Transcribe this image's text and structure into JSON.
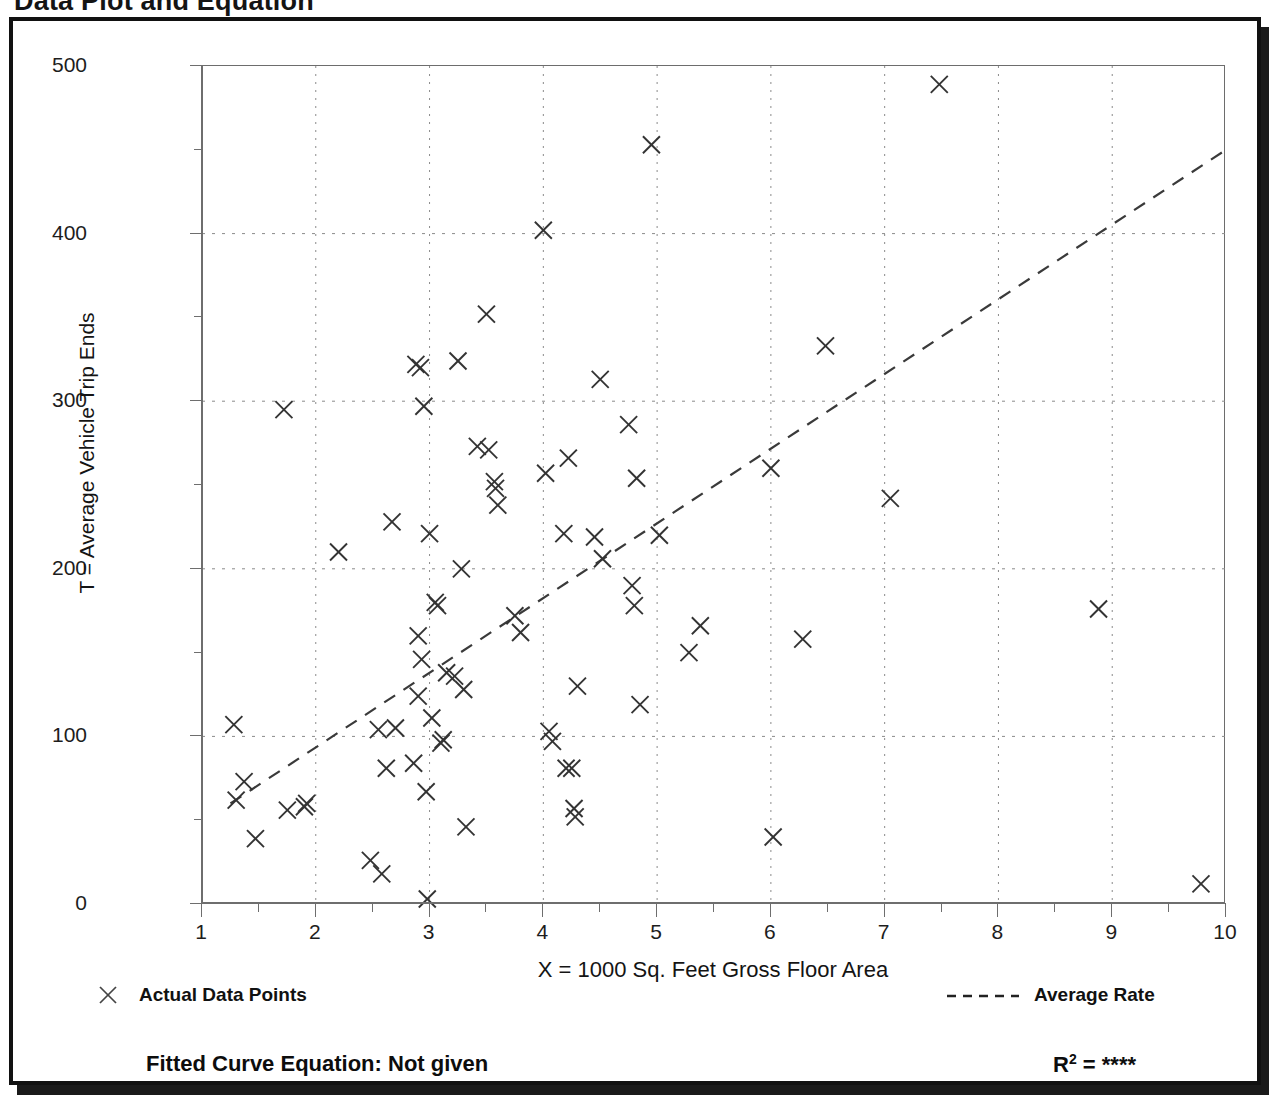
{
  "page": {
    "title": "Data Plot and Equation"
  },
  "footer": {
    "fitted_equation_label": "Fitted Curve Equation:  Not given",
    "r_squared_label": "R",
    "r_squared_exponent": "2",
    "r_squared_value": " = ****"
  },
  "legend": {
    "points_label": "Actual Data Points",
    "line_label": "Average Rate",
    "marker_icon": "x-marker-icon",
    "line_icon": "dashed-line-icon"
  },
  "chart_data": {
    "type": "scatter",
    "title": "Data Plot and Equation",
    "xlabel": "X = 1000 Sq. Feet Gross Floor Area",
    "ylabel": "T = Average Vehicle Trip Ends",
    "xlim": [
      1,
      10
    ],
    "ylim": [
      0,
      500
    ],
    "xticks": [
      1,
      2,
      3,
      4,
      5,
      6,
      7,
      8,
      9,
      10
    ],
    "yticks": [
      0,
      100,
      200,
      300,
      400,
      500
    ],
    "x_minor_step": 0.5,
    "y_minor_step": 50,
    "grid": true,
    "grid_style": "dotted",
    "legend_position": "below-plot",
    "series": [
      {
        "name": "Actual Data Points",
        "marker": "x",
        "color": "#333333",
        "points": [
          [
            1.28,
            107
          ],
          [
            1.3,
            62
          ],
          [
            1.37,
            73
          ],
          [
            1.47,
            39
          ],
          [
            1.72,
            295
          ],
          [
            1.75,
            56
          ],
          [
            1.9,
            58
          ],
          [
            1.92,
            60
          ],
          [
            2.2,
            210
          ],
          [
            2.48,
            26
          ],
          [
            2.55,
            104
          ],
          [
            2.58,
            18
          ],
          [
            2.62,
            81
          ],
          [
            2.67,
            228
          ],
          [
            2.7,
            105
          ],
          [
            2.86,
            84
          ],
          [
            2.88,
            322
          ],
          [
            2.9,
            160
          ],
          [
            2.9,
            124
          ],
          [
            2.92,
            320
          ],
          [
            2.93,
            146
          ],
          [
            2.95,
            297
          ],
          [
            2.97,
            67
          ],
          [
            2.98,
            3
          ],
          [
            3.0,
            221
          ],
          [
            3.02,
            111
          ],
          [
            3.05,
            180
          ],
          [
            3.07,
            178
          ],
          [
            3.1,
            96
          ],
          [
            3.12,
            98
          ],
          [
            3.15,
            138
          ],
          [
            3.22,
            136
          ],
          [
            3.25,
            324
          ],
          [
            3.28,
            200
          ],
          [
            3.3,
            128
          ],
          [
            3.32,
            46
          ],
          [
            3.42,
            273
          ],
          [
            3.5,
            352
          ],
          [
            3.52,
            271
          ],
          [
            3.57,
            252
          ],
          [
            3.58,
            248
          ],
          [
            3.6,
            238
          ],
          [
            3.75,
            172
          ],
          [
            3.8,
            162
          ],
          [
            4.0,
            402
          ],
          [
            4.02,
            257
          ],
          [
            4.05,
            103
          ],
          [
            4.08,
            97
          ],
          [
            4.18,
            221
          ],
          [
            4.2,
            81
          ],
          [
            4.22,
            266
          ],
          [
            4.25,
            81
          ],
          [
            4.27,
            57
          ],
          [
            4.28,
            52
          ],
          [
            4.3,
            130
          ],
          [
            4.45,
            219
          ],
          [
            4.5,
            313
          ],
          [
            4.52,
            206
          ],
          [
            4.75,
            286
          ],
          [
            4.78,
            190
          ],
          [
            4.8,
            178
          ],
          [
            4.82,
            254
          ],
          [
            4.85,
            119
          ],
          [
            4.95,
            453
          ],
          [
            5.02,
            220
          ],
          [
            5.28,
            150
          ],
          [
            5.38,
            166
          ],
          [
            6.0,
            260
          ],
          [
            6.02,
            40
          ],
          [
            6.28,
            158
          ],
          [
            6.48,
            333
          ],
          [
            7.05,
            242
          ],
          [
            7.48,
            489
          ],
          [
            8.88,
            176
          ],
          [
            9.78,
            12
          ]
        ]
      }
    ],
    "trendline": {
      "name": "Average Rate",
      "style": "dashed",
      "color": "#3a3a3a",
      "start": [
        1.25,
        60
      ],
      "end": [
        10.0,
        450
      ]
    }
  }
}
